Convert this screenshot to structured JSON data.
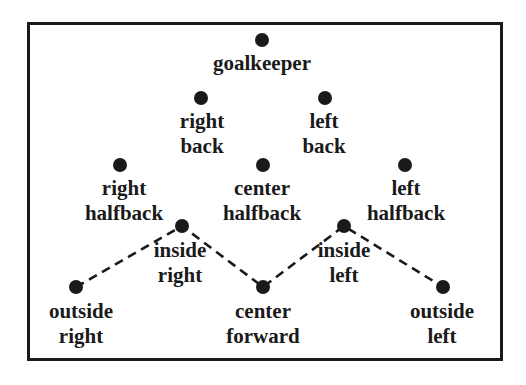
{
  "diagram": {
    "type": "soccer-formation",
    "colors": {
      "ink": "#1a1a1a",
      "background": "#ffffff"
    },
    "players": [
      {
        "id": "goalkeeper",
        "lines": [
          "goalkeeper"
        ],
        "dot": [
          262,
          40
        ],
        "label_pos": [
          262,
          51
        ]
      },
      {
        "id": "right-back",
        "lines": [
          "right",
          "back"
        ],
        "dot": [
          201,
          98
        ],
        "label_pos": [
          202,
          109
        ]
      },
      {
        "id": "left-back",
        "lines": [
          "left",
          "back"
        ],
        "dot": [
          325,
          98
        ],
        "label_pos": [
          324,
          109
        ]
      },
      {
        "id": "right-halfback",
        "lines": [
          "right",
          "halfback"
        ],
        "dot": [
          120,
          165
        ],
        "label_pos": [
          124,
          176
        ]
      },
      {
        "id": "center-halfback",
        "lines": [
          "center",
          "halfback"
        ],
        "dot": [
          263,
          165
        ],
        "label_pos": [
          262,
          176
        ]
      },
      {
        "id": "left-halfback",
        "lines": [
          "left",
          "halfback"
        ],
        "dot": [
          405,
          165
        ],
        "label_pos": [
          406,
          176
        ]
      },
      {
        "id": "inside-right",
        "lines": [
          "inside",
          "right"
        ],
        "dot": [
          182,
          226
        ],
        "label_pos": [
          180,
          238
        ]
      },
      {
        "id": "inside-left",
        "lines": [
          "inside",
          "left"
        ],
        "dot": [
          344,
          226
        ],
        "label_pos": [
          344,
          238
        ]
      },
      {
        "id": "outside-right",
        "lines": [
          "outside",
          "right"
        ],
        "dot": [
          76,
          287
        ],
        "label_pos": [
          81,
          299
        ]
      },
      {
        "id": "center-forward",
        "lines": [
          "center",
          "forward"
        ],
        "dot": [
          263,
          287
        ],
        "label_pos": [
          263,
          299
        ]
      },
      {
        "id": "outside-left",
        "lines": [
          "outside",
          "left"
        ],
        "dot": [
          443,
          287
        ],
        "label_pos": [
          442,
          299
        ]
      }
    ],
    "forward_line": {
      "style": "dashed",
      "path": [
        "outside-right",
        "inside-right",
        "center-forward",
        "inside-left",
        "outside-left"
      ]
    }
  }
}
